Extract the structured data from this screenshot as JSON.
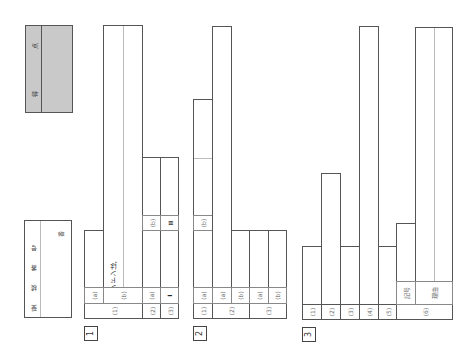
{
  "header": {
    "exam_number_label": "受 検 番 号",
    "exam_number_suffix": "番",
    "score_label_1": "得",
    "score_label_2": "点"
  },
  "sections": [
    {
      "number": "1",
      "questions": [
        {
          "label": "(1)",
          "parts": [
            {
              "label": "(a)",
              "value": ""
            },
            {
              "label": "(b)",
              "value": "ロンドンは,"
            }
          ]
        },
        {
          "label": "(2)",
          "parts": [
            {
              "label": "(a)",
              "value": ""
            },
            {
              "label": "(b)",
              "value": ""
            }
          ]
        },
        {
          "label": "(3)",
          "parts": [
            {
              "label": "I",
              "value": ""
            },
            {
              "label": "II",
              "value": ""
            }
          ]
        }
      ]
    },
    {
      "number": "2",
      "questions": [
        {
          "label": "(1)",
          "parts": [
            {
              "label": "(a)",
              "value": ""
            },
            {
              "label": "(b)",
              "value": ""
            }
          ]
        },
        {
          "label": "(2)",
          "parts": [
            {
              "label": "(a)",
              "value": ""
            },
            {
              "label": "(b)",
              "value": ""
            }
          ]
        },
        {
          "label": "(3)",
          "parts": [
            {
              "label": "(a)",
              "value": ""
            },
            {
              "label": "(b)",
              "value": ""
            }
          ]
        }
      ]
    },
    {
      "number": "3",
      "questions": [
        {
          "label": "(1)",
          "value": ""
        },
        {
          "label": "(2)",
          "value": ""
        },
        {
          "label": "(3)",
          "value": ""
        },
        {
          "label": "(4)",
          "value": ""
        },
        {
          "label": "(5)",
          "value": ""
        },
        {
          "label": "(6)",
          "parts": [
            {
              "label": "記号",
              "value": ""
            },
            {
              "label": "理由",
              "value": ""
            }
          ]
        }
      ]
    }
  ]
}
